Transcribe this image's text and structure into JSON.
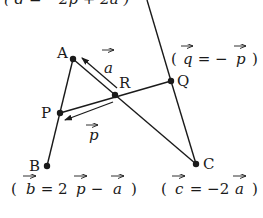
{
  "diagram": {
    "type": "vector-geometry",
    "stroke_color": "#1a1a1a",
    "background": "#ffffff",
    "points": {
      "A": {
        "label": "A",
        "x": 73,
        "y": 59
      },
      "B": {
        "label": "B",
        "x": 47,
        "y": 166
      },
      "C": {
        "label": "C",
        "x": 196,
        "y": 164
      },
      "P": {
        "label": "P",
        "x": 60,
        "y": 113
      },
      "Q": {
        "label": "Q",
        "x": 171,
        "y": 81
      },
      "R": {
        "label": "R",
        "x": 115,
        "y": 95
      }
    },
    "segments": [
      [
        "A",
        "B"
      ],
      [
        "A",
        "C"
      ],
      [
        "P",
        "Q"
      ],
      [
        "Q",
        "C"
      ],
      [
        "Q",
        "D(top, off-screen)"
      ]
    ],
    "vector_arrows": [
      {
        "name": "a",
        "from": "R",
        "to": "A",
        "label": "a"
      },
      {
        "name": "p",
        "from": "R",
        "to": "P",
        "label": "p"
      }
    ],
    "annotations": {
      "top": {
        "open": "(",
        "lhs": "d",
        "eq": "=",
        "rhs": "−2p + 2a",
        "close": ")"
      },
      "q": {
        "open": "(",
        "lhs": "q",
        "eq": "=",
        "rhs": "− p",
        "close": ")"
      },
      "b": {
        "open": "(",
        "lhs": "b",
        "eq": "=",
        "rhs": "2 p − a",
        "close": ")"
      },
      "c": {
        "open": "(",
        "lhs": "c",
        "eq": "=",
        "rhs": "−2 a",
        "close": ")"
      }
    },
    "labels": {
      "A": "A",
      "B": "B",
      "C": "C",
      "P": "P",
      "Q": "Q",
      "R": "R",
      "vec_a": "a",
      "vec_p": "p",
      "top_eq": "( d = −2p + 2a )",
      "q_eq_open": "(",
      "q_eq_var": "q",
      "q_eq_mid": " = − ",
      "q_eq_var2": "p",
      "q_eq_close": ")",
      "b_eq_open": "(",
      "b_eq_var": "b",
      "b_eq_mid": " = 2 ",
      "b_eq_var2": "p",
      "b_eq_mid2": " − ",
      "b_eq_var3": "a",
      "b_eq_close": ")",
      "c_eq_open": "(",
      "c_eq_var": "c",
      "c_eq_mid": " = −2 ",
      "c_eq_var2": "a",
      "c_eq_close": ")"
    }
  }
}
